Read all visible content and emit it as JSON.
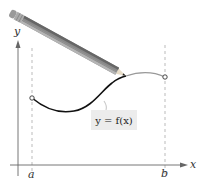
{
  "diagram": {
    "axes": {
      "x_label": "x",
      "y_label": "y"
    },
    "points": {
      "a_label": "a",
      "b_label": "b"
    },
    "function_label": "y = f(x)",
    "curve": {
      "start": {
        "x": 32,
        "y": 98,
        "endpoint": "open-circle"
      },
      "end": {
        "x": 165,
        "y": 77,
        "endpoint": "open-circle"
      },
      "drawn_color": "#111111",
      "undrawn_color": "#999999"
    },
    "pencil": {
      "eraser": {
        "x": 13,
        "y": 14
      },
      "tip": {
        "x": 126,
        "y": 76
      }
    },
    "colors": {
      "axis": "#555555",
      "dashed": "#aaaaaa",
      "label_bg": "#ececec"
    }
  }
}
